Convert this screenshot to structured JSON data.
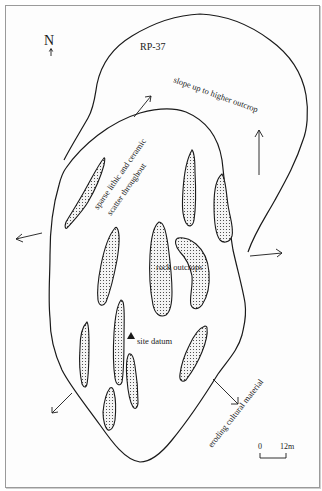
{
  "map": {
    "site_id": "RP-37",
    "north_label": "N",
    "labels": {
      "slope": "slope up to higher outcrop",
      "scatter_line1": "sparse lithic and ceramic",
      "scatter_line2": "scatter throughout",
      "rock_outcrops": "rock outcrops",
      "site_datum": "site datum",
      "eroding": "eroding cultural material"
    },
    "scale": {
      "start": "0",
      "end": "12m"
    },
    "colors": {
      "ink": "#1a1a1a",
      "frame": "#9a9a9a",
      "background": "#ffffff"
    }
  }
}
